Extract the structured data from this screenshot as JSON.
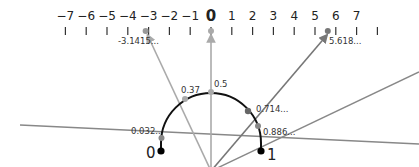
{
  "diagram": {
    "number_line": {
      "ticks": [
        -7,
        -6,
        -5,
        -4,
        -3,
        -2,
        -1,
        0,
        1,
        2,
        3,
        4,
        5,
        6,
        7
      ],
      "tick_labels": [
        "−7",
        "−6",
        "−5",
        "−4",
        "−3",
        "−2",
        "−1",
        "0",
        "1",
        "2",
        "3",
        "4",
        "5",
        "6",
        "7"
      ],
      "marked_points": [
        {
          "value": -3.1415,
          "label": "-3.1415..."
        },
        {
          "value": 0,
          "label": ""
        },
        {
          "value": 5.618,
          "label": "5.618..."
        }
      ]
    },
    "semicircle": {
      "endpoint_labels": {
        "left": "0",
        "right": "1"
      },
      "points": [
        {
          "label": "0.032...",
          "value": 0.032
        },
        {
          "label": "0.37",
          "value": 0.37
        },
        {
          "label": "0.5",
          "value": 0.5
        },
        {
          "label": "0.714...",
          "value": 0.714
        },
        {
          "label": "0.886...",
          "value": 0.886
        }
      ]
    },
    "colors": {
      "axis": "#333333",
      "arc": "#111111",
      "ray_light": "#aaaaaa",
      "ray_mid": "#8a8a8a",
      "ray_dark": "#666666",
      "point": "#000000"
    }
  }
}
